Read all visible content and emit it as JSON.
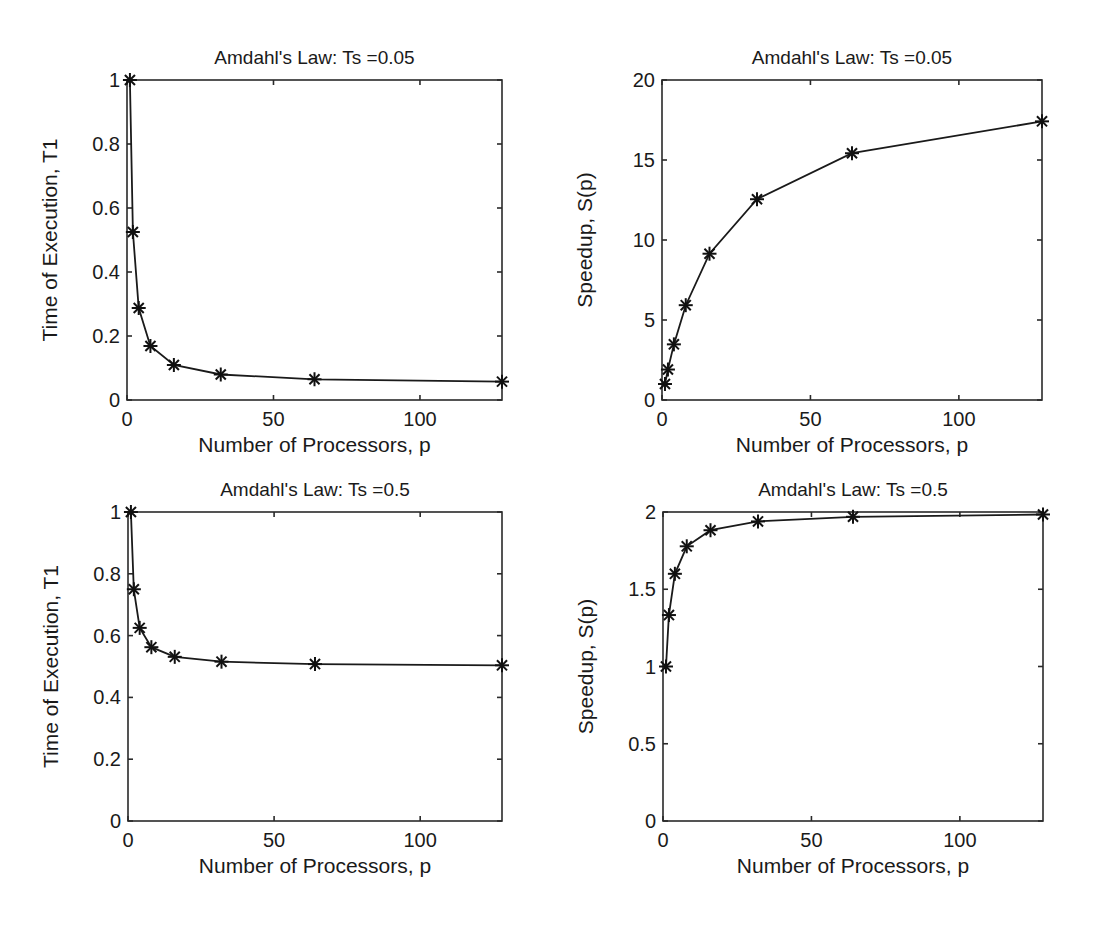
{
  "chart_data": [
    {
      "id": "tl",
      "type": "line",
      "title": "Amdahl's Law:  Ts =0.05",
      "xlabel": "Number of Processors, p",
      "ylabel": "Time of Execution, T1",
      "x": [
        1,
        2,
        4,
        8,
        16,
        32,
        64,
        128
      ],
      "series": [
        {
          "name": "T1",
          "marker": "asterisk",
          "values": [
            1.0,
            0.525,
            0.2875,
            0.16875,
            0.109375,
            0.0796875,
            0.06484375,
            0.057421875
          ]
        }
      ],
      "xlim": [
        0,
        128
      ],
      "ylim": [
        0,
        1
      ],
      "xticks": [
        0,
        50,
        100
      ],
      "xtick_labels": [
        "0",
        "50",
        "100"
      ],
      "yticks": [
        0,
        0.2,
        0.4,
        0.6,
        0.8,
        1
      ],
      "ytick_labels": [
        "0",
        "0.2",
        "0.4",
        "0.6",
        "0.8",
        "1"
      ],
      "grid": false,
      "legend": null,
      "frame": {
        "x0": 127,
        "x1": 502,
        "y0": 80,
        "y1": 400
      }
    },
    {
      "id": "tr",
      "type": "line",
      "title": "Amdahl's Law:  Ts =0.05",
      "xlabel": "Number of Processors, p",
      "ylabel": "Speedup, S(p)",
      "x": [
        1,
        2,
        4,
        8,
        16,
        32,
        64,
        128
      ],
      "series": [
        {
          "name": "S(p)",
          "marker": "asterisk",
          "values": [
            1.0,
            1.905,
            3.478,
            5.926,
            9.143,
            12.549,
            15.422,
            17.415
          ]
        }
      ],
      "xlim": [
        0,
        128
      ],
      "ylim": [
        0,
        20
      ],
      "xticks": [
        0,
        50,
        100
      ],
      "xtick_labels": [
        "0",
        "50",
        "100"
      ],
      "yticks": [
        0,
        5,
        10,
        15,
        20
      ],
      "ytick_labels": [
        "0",
        "5",
        "10",
        "15",
        "20"
      ],
      "grid": false,
      "legend": null,
      "frame": {
        "x0": 662,
        "x1": 1042,
        "y0": 80,
        "y1": 400
      }
    },
    {
      "id": "bl",
      "type": "line",
      "title": "Amdahl's Law:  Ts =0.5",
      "xlabel": "Number of Processors, p",
      "ylabel": "Time of Execution, T1",
      "x": [
        1,
        2,
        4,
        8,
        16,
        32,
        64,
        128
      ],
      "series": [
        {
          "name": "T1",
          "marker": "asterisk",
          "values": [
            1.0,
            0.75,
            0.625,
            0.5625,
            0.53125,
            0.515625,
            0.5078125,
            0.50390625
          ]
        }
      ],
      "xlim": [
        0,
        128
      ],
      "ylim": [
        0,
        1
      ],
      "xticks": [
        0,
        50,
        100
      ],
      "xtick_labels": [
        "0",
        "50",
        "100"
      ],
      "yticks": [
        0,
        0.2,
        0.4,
        0.6,
        0.8,
        1
      ],
      "ytick_labels": [
        "0",
        "0.2",
        "0.4",
        "0.6",
        "0.8",
        "1"
      ],
      "grid": false,
      "legend": null,
      "frame": {
        "x0": 128,
        "x1": 502,
        "y0": 512,
        "y1": 821
      }
    },
    {
      "id": "br",
      "type": "line",
      "title": "Amdahl's Law:  Ts =0.5",
      "xlabel": "Number of Processors, p",
      "ylabel": "Speedup, S(p)",
      "x": [
        1,
        2,
        4,
        8,
        16,
        32,
        64,
        128
      ],
      "series": [
        {
          "name": "S(p)",
          "marker": "asterisk",
          "values": [
            1.0,
            1.333,
            1.6,
            1.778,
            1.882,
            1.939,
            1.969,
            1.984
          ]
        }
      ],
      "xlim": [
        0,
        128
      ],
      "ylim": [
        0,
        2
      ],
      "xticks": [
        0,
        50,
        100
      ],
      "xtick_labels": [
        "0",
        "50",
        "100"
      ],
      "yticks": [
        0,
        0.5,
        1,
        1.5,
        2
      ],
      "ytick_labels": [
        "0",
        "0.5",
        "1",
        "1.5",
        "2"
      ],
      "grid": false,
      "legend": null,
      "frame": {
        "x0": 663,
        "x1": 1043,
        "y0": 512,
        "y1": 821
      }
    }
  ]
}
